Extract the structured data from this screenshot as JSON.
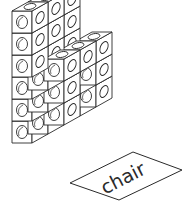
{
  "illustration": {
    "subject": "chair built from connecting cubes",
    "line_color": "#2a2a2a",
    "fill_color": "#ffffff",
    "cube": {
      "w": 20,
      "h": 22,
      "dx": 16,
      "dy": -9
    },
    "cubes": [
      {
        "gx": 2,
        "gy": 0,
        "gz": 5
      },
      {
        "gx": 2,
        "gy": 0,
        "gz": 4
      },
      {
        "gx": 2,
        "gy": 0,
        "gz": 3
      },
      {
        "gx": 1,
        "gy": 0,
        "gz": 5
      },
      {
        "gx": 1,
        "gy": 0,
        "gz": 4
      },
      {
        "gx": 1,
        "gy": 0,
        "gz": 3
      },
      {
        "gx": 0,
        "gy": 0,
        "gz": 5
      },
      {
        "gx": 0,
        "gy": 0,
        "gz": 4
      },
      {
        "gx": 0,
        "gy": 0,
        "gz": 3
      },
      {
        "gx": 2,
        "gy": 1,
        "gz": 2
      },
      {
        "gx": 2,
        "gy": 1,
        "gz": 1
      },
      {
        "gx": 2,
        "gy": 1,
        "gz": 0
      },
      {
        "gx": 2,
        "gy": 2,
        "gz": 2
      },
      {
        "gx": 2,
        "gy": 2,
        "gz": 1
      },
      {
        "gx": 2,
        "gy": 2,
        "gz": 0
      },
      {
        "gx": 1,
        "gy": 1,
        "gz": 2
      },
      {
        "gx": 1,
        "gy": 2,
        "gz": 2
      },
      {
        "gx": 0,
        "gy": 0,
        "gz": 2
      },
      {
        "gx": 0,
        "gy": 0,
        "gz": 1
      },
      {
        "gx": 0,
        "gy": 0,
        "gz": 0
      },
      {
        "gx": 0,
        "gy": 1,
        "gz": 2
      },
      {
        "gx": 0,
        "gy": 1,
        "gz": 1
      },
      {
        "gx": 0,
        "gy": 1,
        "gz": 0
      },
      {
        "gx": 0,
        "gy": 2,
        "gz": 2
      },
      {
        "gx": 0,
        "gy": 2,
        "gz": 1
      },
      {
        "gx": 0,
        "gy": 2,
        "gz": 0
      }
    ],
    "origin": {
      "x": 12,
      "y": 143
    }
  },
  "label_card": {
    "text": "chair",
    "points": "70,183 133,152 182,170 119,200",
    "text_x": 126,
    "text_y": 184,
    "rotate": -27
  }
}
